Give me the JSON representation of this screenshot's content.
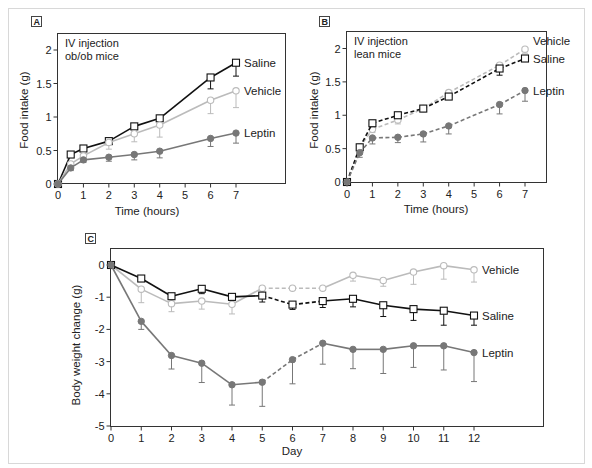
{
  "chart_data": [
    {
      "id": "A",
      "type": "line",
      "panel_label": "A",
      "annotation": [
        "IV injection",
        "ob/ob mice"
      ],
      "xlabel": "Time (hours)",
      "ylabel": "Food intake (g)",
      "xlim": [
        0,
        8
      ],
      "ylim": [
        0,
        2.25
      ],
      "xticks": [
        0,
        1,
        2,
        3,
        4,
        5,
        6,
        7
      ],
      "yticks": [
        0,
        0.5,
        1,
        1.5,
        2
      ],
      "ytick_labels": [
        "0",
        "0.5",
        "1",
        "1.5",
        "2"
      ],
      "grid": false,
      "legend": "inline-right",
      "series": [
        {
          "name": "Saline",
          "marker": "square",
          "color": "#111111",
          "dash": "solid",
          "x": [
            0,
            0.5,
            1,
            2,
            3,
            4,
            6,
            7
          ],
          "y": [
            0,
            0.44,
            0.53,
            0.64,
            0.86,
            0.98,
            1.59,
            1.81
          ],
          "err": [
            0,
            0,
            0.03,
            0,
            0.05,
            0.05,
            0.17,
            0.2
          ]
        },
        {
          "name": "Vehicle",
          "marker": "circle-open",
          "color": "#bbbbbb",
          "dash": "solid",
          "x": [
            0,
            0.5,
            1,
            2,
            3,
            4,
            6,
            7
          ],
          "y": [
            0,
            0.3,
            0.42,
            0.62,
            0.75,
            0.88,
            1.25,
            1.39
          ],
          "err": [
            0,
            0.05,
            0.05,
            0.1,
            0.12,
            0.18,
            0.2,
            0.25
          ]
        },
        {
          "name": "Leptin",
          "marker": "circle-filled",
          "color": "#777777",
          "dash": "solid",
          "x": [
            0,
            0.5,
            1,
            2,
            3,
            4,
            6,
            7
          ],
          "y": [
            0,
            0.24,
            0.36,
            0.4,
            0.44,
            0.49,
            0.68,
            0.76
          ],
          "err": [
            0,
            0.04,
            0.04,
            0.06,
            0.08,
            0.1,
            0.12,
            0.15
          ]
        }
      ]
    },
    {
      "id": "B",
      "type": "line",
      "panel_label": "B",
      "annotation": [
        "IV injection",
        "lean mice"
      ],
      "xlabel": "Time (hours)",
      "ylabel": "Food intake (g)",
      "xlim": [
        0,
        7.8
      ],
      "ylim": [
        0,
        2.25
      ],
      "xticks": [
        0,
        1,
        2,
        3,
        4,
        5,
        6,
        7
      ],
      "yticks": [
        0,
        0.5,
        1,
        1.5,
        2
      ],
      "ytick_labels": [
        "0",
        "0.5",
        "1",
        "1.5",
        "2"
      ],
      "grid": false,
      "legend": "inline-right",
      "series": [
        {
          "name": "Vehicle",
          "marker": "circle-open",
          "color": "#bbbbbb",
          "dash": "dashed",
          "x": [
            0,
            0.5,
            1,
            2,
            3,
            4,
            6,
            7
          ],
          "y": [
            0,
            0.52,
            0.79,
            0.93,
            1.1,
            1.34,
            1.75,
            1.99
          ],
          "err": [
            0,
            0.05,
            0.05,
            0.06,
            0.05,
            0.05,
            0.05,
            0.06
          ]
        },
        {
          "name": "Saline",
          "marker": "square",
          "color": "#111111",
          "dash": "dashed",
          "x": [
            0,
            0.5,
            1,
            2,
            3,
            4,
            6,
            7
          ],
          "y": [
            0,
            0.52,
            0.88,
            1.0,
            1.1,
            1.28,
            1.7,
            1.85
          ],
          "err": [
            0,
            0.06,
            0.05,
            0.03,
            0.04,
            0.03,
            0.1,
            0.04
          ]
        },
        {
          "name": "Leptin",
          "marker": "circle-filled",
          "color": "#777777",
          "dash": "dashed",
          "x": [
            0,
            0.5,
            1,
            2,
            3,
            4,
            6,
            7
          ],
          "y": [
            0,
            0.44,
            0.66,
            0.67,
            0.72,
            0.84,
            1.16,
            1.37
          ],
          "err": [
            0,
            0.07,
            0.09,
            0.08,
            0.12,
            0.12,
            0.14,
            0.16
          ]
        }
      ]
    },
    {
      "id": "C",
      "type": "line",
      "panel_label": "C",
      "xlabel": "Day",
      "ylabel": "Body weight change (g)",
      "xlim": [
        0,
        14
      ],
      "ylim": [
        -5,
        0.55
      ],
      "xticks": [
        0,
        1,
        2,
        3,
        4,
        5,
        6,
        7,
        8,
        9,
        10,
        11,
        12
      ],
      "yticks": [
        0,
        -1,
        -2,
        -3,
        -4,
        -5
      ],
      "ytick_labels": [
        "0",
        "-1",
        "-2",
        "-3",
        "-4",
        "-5"
      ],
      "grid": false,
      "legend": "inline-right",
      "dashed_segment_days": [
        5,
        7
      ],
      "series": [
        {
          "name": "Vehicle",
          "marker": "circle-open",
          "color": "#bbbbbb",
          "x": [
            0,
            1,
            2,
            3,
            4,
            5,
            6,
            7,
            8,
            9,
            10,
            11,
            12
          ],
          "y": [
            0,
            -0.75,
            -1.2,
            -1.12,
            -1.22,
            -0.72,
            -0.72,
            -0.72,
            -0.32,
            -0.48,
            -0.22,
            -0.02,
            -0.15
          ],
          "err": [
            0,
            -0.42,
            -0.25,
            -0.25,
            -0.3,
            0,
            0,
            0,
            -0.18,
            -0.18,
            -0.38,
            -0.42,
            -0.38
          ]
        },
        {
          "name": "Saline",
          "marker": "square",
          "color": "#111111",
          "x": [
            0,
            1,
            2,
            3,
            4,
            5,
            6,
            7,
            8,
            9,
            10,
            11,
            12
          ],
          "y": [
            0,
            -0.42,
            -0.97,
            -0.74,
            -0.99,
            -0.95,
            -1.23,
            -1.12,
            -1.05,
            -1.25,
            -1.37,
            -1.42,
            -1.57
          ],
          "err": [
            0,
            0,
            -0.1,
            -0.15,
            -0.1,
            -0.2,
            -0.15,
            -0.2,
            -0.25,
            -0.35,
            -0.35,
            -0.45,
            -0.3
          ]
        },
        {
          "name": "Leptin",
          "marker": "circle-filled",
          "color": "#777777",
          "x": [
            0,
            1,
            2,
            3,
            4,
            5,
            6,
            7,
            8,
            9,
            10,
            11,
            12
          ],
          "y": [
            0,
            -1.75,
            -2.81,
            -3.05,
            -3.72,
            -3.64,
            -2.94,
            -2.43,
            -2.62,
            -2.62,
            -2.51,
            -2.51,
            -2.72
          ],
          "err": [
            0,
            -0.25,
            -0.42,
            -0.6,
            -0.63,
            -0.75,
            -0.75,
            -0.65,
            -0.6,
            -0.75,
            -0.67,
            -0.75,
            -0.9
          ]
        }
      ]
    }
  ]
}
